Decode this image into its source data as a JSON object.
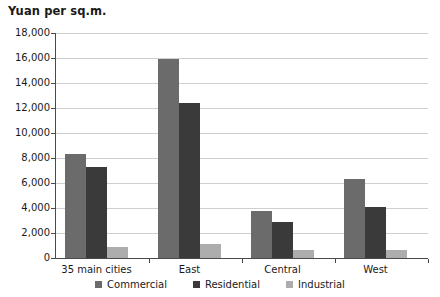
{
  "chart_data": {
    "type": "bar",
    "title": "Yuan per sq.m.",
    "xlabel": "",
    "ylabel": "Yuan per sq.m.",
    "ylim": [
      0,
      18000
    ],
    "ytick_step": 2000,
    "yticks": [
      "18,000",
      "16,000",
      "14,000",
      "12,000",
      "10,000",
      "8,000",
      "6,000",
      "4,000",
      "2,000",
      "0"
    ],
    "grid": true,
    "legend_position": "bottom",
    "categories": [
      "35 main cities",
      "East",
      "Central",
      "West"
    ],
    "series": [
      {
        "name": "Commercial",
        "color": "#6b6b6b",
        "values": [
          8350,
          15900,
          3750,
          6300
        ]
      },
      {
        "name": "Residential",
        "color": "#3a3a3a",
        "values": [
          7250,
          12400,
          2900,
          4050
        ]
      },
      {
        "name": "Industrial",
        "color": "#adadad",
        "values": [
          900,
          1100,
          650,
          600
        ]
      }
    ]
  },
  "axis": {
    "title": "Yuan per sq.m."
  },
  "legend": {
    "items": [
      {
        "label": "Commercial",
        "swatch_name": "legend-swatch-commercial"
      },
      {
        "label": "Residential",
        "swatch_name": "legend-swatch-residential"
      },
      {
        "label": "Industrial",
        "swatch_name": "legend-swatch-industrial"
      }
    ]
  }
}
